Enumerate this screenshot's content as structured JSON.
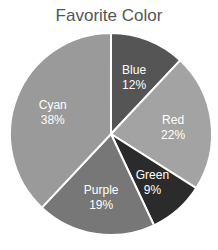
{
  "chart_data": {
    "type": "pie",
    "title": "Favorite Color",
    "categories": [
      "Blue",
      "Red",
      "Green",
      "Purple",
      "Cyan"
    ],
    "values": [
      12,
      22,
      9,
      19,
      38
    ],
    "labels": [
      "12%",
      "22%",
      "9%",
      "19%",
      "38%"
    ],
    "colors": [
      "#555555",
      "#a3a3a3",
      "#2b2b2b",
      "#777777",
      "#9a9a9a"
    ],
    "start_angle_deg": 0,
    "direction": "clockwise",
    "legend": "none"
  }
}
